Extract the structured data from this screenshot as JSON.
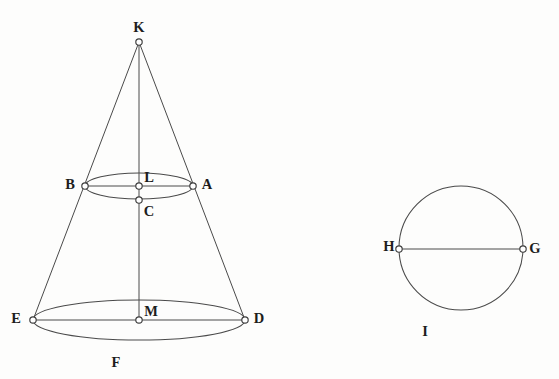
{
  "figure": {
    "background_color": "#fdfdfc",
    "stroke_color": "#4a4a4a",
    "label_color": "#1d1d1d",
    "width": 559,
    "height": 379
  },
  "cone": {
    "apex": {
      "name": "K",
      "x": 139,
      "y": 42,
      "label_x": 139,
      "label_y": 27
    },
    "axis": {
      "from": "K",
      "to": "M",
      "description": "vertical axis of the cone"
    },
    "upper_section": {
      "description": "small ellipse (upper circular cross-section seen in perspective)",
      "center_x": 139,
      "center_y": 186,
      "rx": 54,
      "ry": 13,
      "points": [
        {
          "name": "B",
          "x": 85,
          "y": 186,
          "label_x": 70,
          "label_y": 184
        },
        {
          "name": "L",
          "x": 139,
          "y": 186,
          "label_x": 149,
          "label_y": 177
        },
        {
          "name": "A",
          "x": 193,
          "y": 186,
          "label_x": 207,
          "label_y": 184
        },
        {
          "name": "C",
          "x": 139,
          "y": 200,
          "label_x": 149,
          "label_y": 211
        }
      ],
      "chord": {
        "from": "B",
        "to": "A"
      }
    },
    "lower_section": {
      "description": "large ellipse (base circular cross-section seen in perspective)",
      "center_x": 139,
      "center_y": 320,
      "rx": 106,
      "ry": 20,
      "points": [
        {
          "name": "E",
          "x": 33,
          "y": 320,
          "label_x": 16,
          "label_y": 318
        },
        {
          "name": "M",
          "x": 139,
          "y": 320,
          "label_x": 151,
          "label_y": 311
        },
        {
          "name": "D",
          "x": 245,
          "y": 320,
          "label_x": 259,
          "label_y": 318
        },
        {
          "name": "F",
          "x": 116,
          "y": 340,
          "label_x": 116,
          "label_y": 362
        }
      ],
      "chord": {
        "from": "E",
        "to": "D"
      }
    },
    "slant_edges": [
      {
        "from": "K",
        "to": "E"
      },
      {
        "from": "K",
        "to": "D"
      }
    ]
  },
  "circle_figure": {
    "description": "separate standalone circle with horizontal diameter",
    "center_x": 461,
    "center_y": 248,
    "radius": 62,
    "points": [
      {
        "name": "H",
        "x": 399,
        "y": 249,
        "label_x": 389,
        "label_y": 246
      },
      {
        "name": "G",
        "x": 523,
        "y": 249,
        "label_x": 535,
        "label_y": 248
      },
      {
        "name": "I",
        "x": 425,
        "y": 310,
        "label_x": 425,
        "label_y": 331
      }
    ],
    "diameter": {
      "from": "H",
      "to": "G"
    }
  },
  "labels": {
    "K": "K",
    "B": "B",
    "L": "L",
    "A": "A",
    "C": "C",
    "E": "E",
    "M": "M",
    "D": "D",
    "F": "F",
    "H": "H",
    "G": "G",
    "I": "I"
  }
}
